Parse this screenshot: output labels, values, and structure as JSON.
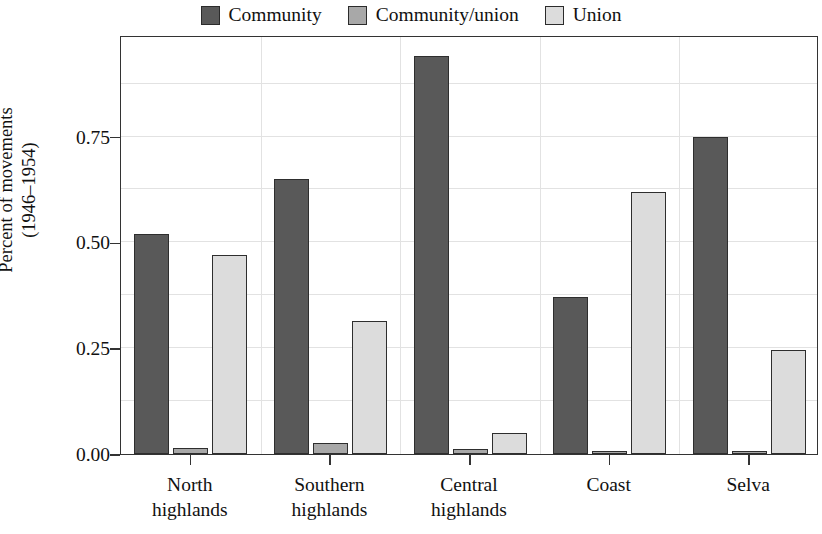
{
  "chart_data": {
    "type": "bar",
    "title": "",
    "subtitle": "",
    "xlabel": "",
    "ylabel": "Percent of movements (1946–1954)",
    "ylabel_line1": "Percent of movements",
    "ylabel_line2": "(1946–1954)",
    "categories": [
      "North highlands",
      "Southern highlands",
      "Central highlands",
      "Coast",
      "Selva"
    ],
    "category_lines": [
      [
        "North",
        "highlands"
      ],
      [
        "Southern",
        "highlands"
      ],
      [
        "Central",
        "highlands"
      ],
      [
        "Coast",
        ""
      ],
      [
        "Selva",
        ""
      ]
    ],
    "series": [
      {
        "name": "Community",
        "color": "#595959",
        "values": [
          0.52,
          0.65,
          0.94,
          0.37,
          0.75
        ]
      },
      {
        "name": "Community/union",
        "color": "#a8a8a8",
        "values": [
          0.015,
          0.025,
          0.012,
          0.004,
          0.005
        ]
      },
      {
        "name": "Union",
        "color": "#dcdcdc",
        "values": [
          0.47,
          0.315,
          0.05,
          0.62,
          0.245
        ]
      }
    ],
    "ylim": [
      0.0,
      0.99
    ],
    "yticks": [
      0.0,
      0.25,
      0.5,
      0.75
    ],
    "ytick_labels": [
      "0.00",
      "0.25",
      "0.50",
      "0.75"
    ],
    "minor_gridlines": [
      0.125,
      0.375,
      0.625,
      0.875
    ],
    "grid": true,
    "grid_color": "#e2e2e2",
    "legend_position": "top-center",
    "legend_entries": [
      "Community",
      "Community/union",
      "Union"
    ],
    "axis_color": "#333333",
    "bar_outline_color": "#2e2e2e",
    "background": "#ffffff"
  }
}
